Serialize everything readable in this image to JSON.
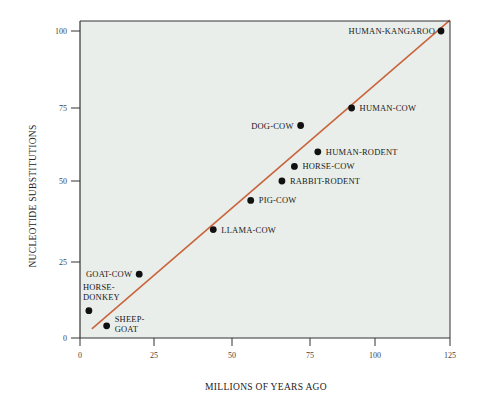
{
  "chart_data": {
    "type": "scatter",
    "title": "",
    "xlabel": "MILLIONS OF YEARS AGO",
    "ylabel": "NUCLEOTIDE SUBSTITUTIONS",
    "xlim": [
      0,
      125
    ],
    "ylim": [
      0,
      103
    ],
    "grid": false,
    "x_ticks": [
      0,
      25,
      50,
      75,
      100,
      125
    ],
    "y_ticks": [
      0,
      25,
      50,
      75,
      100
    ],
    "points": [
      {
        "label": "HORSE-DONKEY",
        "x": 3,
        "y": 9
      },
      {
        "label": "SHEEP-GOAT",
        "x": 9,
        "y": 4
      },
      {
        "label": "GOAT-COW",
        "x": 20,
        "y": 21
      },
      {
        "label": "LLAMA-COW",
        "x": 44,
        "y": 35
      },
      {
        "label": "PIG-COW",
        "x": 56,
        "y": 44
      },
      {
        "label": "RABBIT-RODENT",
        "x": 66,
        "y": 50
      },
      {
        "label": "HORSE-COW",
        "x": 70,
        "y": 55
      },
      {
        "label": "HUMAN-RODENT",
        "x": 78,
        "y": 60
      },
      {
        "label": "DOG-COW",
        "x": 72,
        "y": 69
      },
      {
        "label": "HUMAN-COW",
        "x": 91,
        "y": 75
      },
      {
        "label": "HUMAN-KANGAROO",
        "x": 122,
        "y": 100
      }
    ],
    "fit_line": {
      "x1": 4,
      "y1": 3,
      "x2": 125,
      "y2": 103.5
    },
    "colors": {
      "plot_background": "#e9eeea",
      "fit_line": "#c9653d",
      "point": "#111111",
      "axis": "#333333"
    }
  }
}
